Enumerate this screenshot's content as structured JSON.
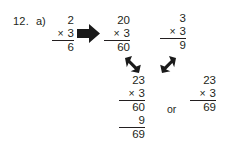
{
  "page": {
    "background": "#ffffff",
    "ink": "#231f20"
  },
  "problem": {
    "number": "12.",
    "part": "a)",
    "topic": "distributive-property-multiplication"
  },
  "steps": {
    "start": {
      "multiplicand": "2",
      "operator": "×",
      "multiplier": "3",
      "product": "6"
    },
    "tens": {
      "multiplicand": "20",
      "operator": "×",
      "multiplier": "3",
      "product": "60"
    },
    "ones": {
      "multiplicand": "3",
      "operator": "×",
      "multiplier": "3",
      "product": "9"
    },
    "expanded": {
      "multiplicand": "23",
      "operator": "×",
      "multiplier": "3",
      "partial_tens": "60",
      "partial_ones": "9",
      "total": "69"
    },
    "compact": {
      "multiplicand": "23",
      "operator": "×",
      "multiplier": "3",
      "product": "69"
    },
    "connector": "or"
  },
  "arrows": {
    "right": "arrow-right-icon",
    "down_right": "arrow-down-right-icon",
    "down_left": "arrow-down-left-icon"
  }
}
